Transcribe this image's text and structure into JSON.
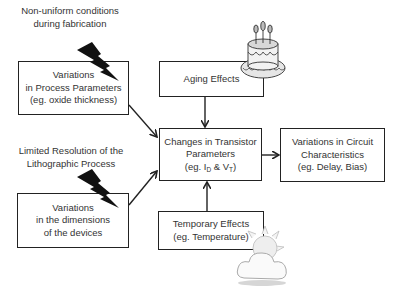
{
  "captions": {
    "fabrication": [
      "Non-uniform conditions",
      "during fabrication"
    ],
    "lithography": [
      "Limited Resolution of the",
      "Lithographic Process"
    ]
  },
  "boxes": {
    "process_params": [
      "Variations",
      "in Process Parameters",
      "(eg. oxide thickness)"
    ],
    "dimensions": [
      "Variations",
      "in the dimensions",
      "of the devices"
    ],
    "aging": [
      "Aging Effects"
    ],
    "transistor": {
      "line1": "Changes in Transistor",
      "line2": "Parameters",
      "prefix": "(eg. I",
      "sub1": "D",
      "mid": " & V",
      "sub2": "T",
      "suffix": ")"
    },
    "circuit": [
      "Variations in Circuit",
      "Characteristics",
      "(eg. Delay, Bias)"
    ],
    "temporary": [
      "Temporary Effects",
      "(eg. Temperature)"
    ]
  },
  "icons": {
    "lightning": "lightning-bolt-icon",
    "cake": "birthday-cake-icon",
    "weather": "sun-cloud-icon"
  },
  "colors": {
    "stroke": "#222222",
    "text": "#333333",
    "background": "#ffffff"
  }
}
